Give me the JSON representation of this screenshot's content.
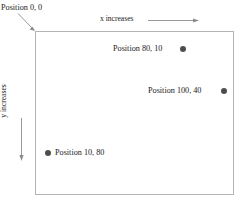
{
  "diagram": {
    "title_text": "",
    "origin": {
      "label": "Position 0, 0"
    },
    "axes": {
      "x": {
        "label": "x increases",
        "direction": "right"
      },
      "y": {
        "label": "y increases",
        "direction": "down"
      }
    },
    "points": [
      {
        "label": "Position 80, 10",
        "x": 80,
        "y": 10,
        "dot_side": "right",
        "dot_color": "#4d4d4d"
      },
      {
        "label": "Position 100, 40",
        "x": 100,
        "y": 40,
        "dot_side": "right",
        "dot_color": "#4d4d4d"
      },
      {
        "label": "Position 10, 80",
        "x": 10,
        "y": 80,
        "dot_side": "left",
        "dot_color": "#4d4d4d"
      }
    ],
    "colors": {
      "background": "#ffffff",
      "box_border": "#b4b4b4",
      "arrow": "#8c8c8c",
      "text": "#1a1a1a",
      "dot": "#4d4d4d"
    }
  }
}
